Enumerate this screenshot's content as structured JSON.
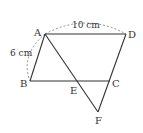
{
  "figure": {
    "type": "parallelogram-geometry",
    "points": {
      "A": {
        "label": "A",
        "x": 45,
        "y": 34
      },
      "B": {
        "label": "B",
        "x": 30,
        "y": 81
      },
      "C": {
        "label": "C",
        "x": 110,
        "y": 81
      },
      "D": {
        "label": "D",
        "x": 126,
        "y": 34
      },
      "E": {
        "label": "E",
        "x": 77,
        "y": 81
      },
      "F": {
        "label": "F",
        "x": 98,
        "y": 112
      }
    },
    "measurements": {
      "AD": "10 cm",
      "AB": "6 cm"
    },
    "colors": {
      "line": "#333333",
      "dashed": "#777777",
      "background": "#ffffff"
    }
  }
}
